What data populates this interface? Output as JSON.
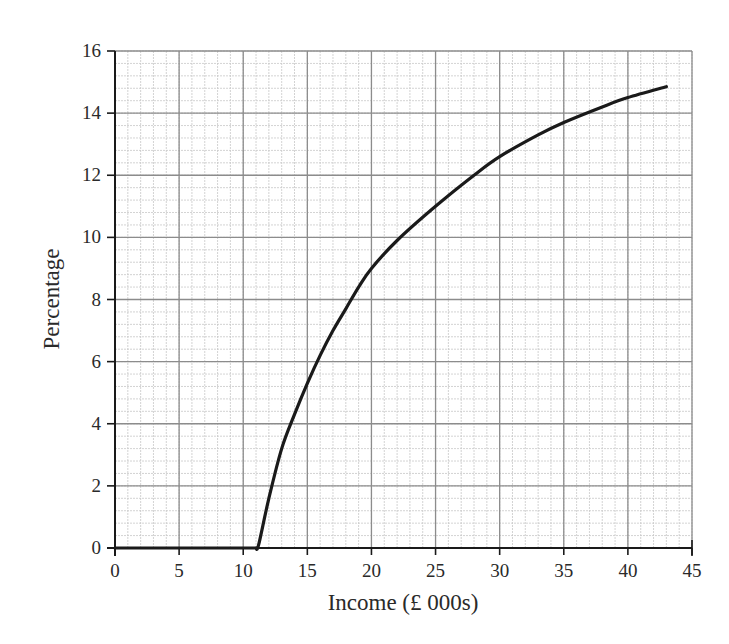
{
  "chart_data": {
    "type": "line",
    "title": "",
    "xlabel": "Income (£ 000s)",
    "ylabel": "Percentage",
    "xlim": [
      0,
      45
    ],
    "ylim": [
      0,
      16
    ],
    "x_ticks": [
      0,
      5,
      10,
      15,
      20,
      25,
      30,
      35,
      40,
      45
    ],
    "y_ticks": [
      0,
      2,
      4,
      6,
      8,
      10,
      12,
      14,
      16
    ],
    "x_minor_step": 1,
    "y_minor_step": 0.4,
    "grid": true,
    "legend": null,
    "series": [
      {
        "name": "Percentage",
        "color": "#1a1a1a",
        "x": [
          0,
          5,
          10,
          11,
          11.2,
          12,
          13,
          14,
          15,
          16,
          17,
          18,
          19,
          20,
          22,
          25,
          28,
          30,
          33,
          35,
          38,
          40,
          43
        ],
        "y": [
          0,
          0,
          0,
          0,
          0.1,
          1.6,
          3.2,
          4.3,
          5.3,
          6.2,
          7.0,
          7.7,
          8.4,
          9.0,
          9.9,
          11.0,
          12.0,
          12.6,
          13.3,
          13.7,
          14.2,
          14.5,
          14.85
        ]
      }
    ]
  },
  "colors": {
    "background": "#ffffff",
    "major_grid": "#8c8c8c",
    "minor_grid": "#c8c8c8",
    "axis": "#1a1a1a",
    "curve": "#1a1a1a"
  }
}
